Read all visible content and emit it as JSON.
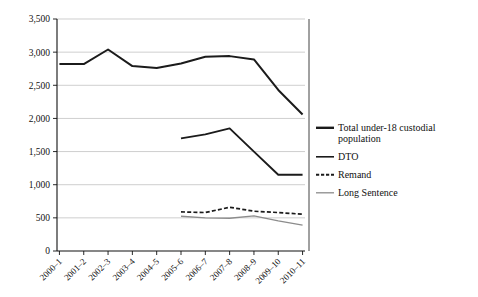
{
  "chart_data": {
    "type": "line",
    "title": "",
    "subtitle": "",
    "xlabel": "",
    "ylabel": "",
    "ylim": [
      0,
      3500
    ],
    "ytick_labels": [
      "0",
      "500",
      "1,000",
      "1,500",
      "2,000",
      "2,500",
      "3,000",
      "3,500"
    ],
    "ytick_values": [
      0,
      500,
      1000,
      1500,
      2000,
      2500,
      3000,
      3500
    ],
    "grid": "horizontal",
    "legend_position": "right",
    "categories": [
      "2000–1",
      "2001–2",
      "2002–3",
      "2003–4",
      "2004–5",
      "2005–6",
      "2006–7",
      "2007–8",
      "2008–9",
      "2009–10",
      "2010–11"
    ],
    "series": [
      {
        "name": "Total under-18 custodial population",
        "style": "solid-thick",
        "color": "#1b1b1b",
        "values": [
          2820,
          2820,
          3040,
          2790,
          2760,
          2830,
          2930,
          2940,
          2890,
          2430,
          2060
        ]
      },
      {
        "name": "DTO",
        "style": "solid",
        "color": "#1b1b1b",
        "values": [
          null,
          null,
          null,
          null,
          null,
          1700,
          1760,
          1850,
          1500,
          1150,
          1150
        ]
      },
      {
        "name": "Remand",
        "style": "dashed",
        "color": "#1b1b1b",
        "values": [
          null,
          null,
          null,
          null,
          null,
          590,
          580,
          660,
          600,
          580,
          555
        ]
      },
      {
        "name": "Long Sentence",
        "style": "solid-thin",
        "color": "#8c8c8c",
        "values": [
          null,
          null,
          null,
          null,
          null,
          525,
          500,
          495,
          530,
          455,
          390
        ]
      }
    ]
  },
  "legend": {
    "entries": [
      {
        "label": "Total under-18 custodial",
        "label2": "population",
        "swatch": "legend-swatch-total"
      },
      {
        "label": "DTO",
        "label2": "",
        "swatch": "legend-swatch-dto"
      },
      {
        "label": "Remand",
        "label2": "",
        "swatch": "legend-swatch-remand"
      },
      {
        "label": "Long Sentence",
        "label2": "",
        "swatch": "legend-swatch-long"
      }
    ]
  },
  "colors": {
    "ink": "#1b1b1b",
    "grid": "#b9b9b9",
    "long_sentence": "#8c8c8c",
    "background": "#ffffff"
  }
}
